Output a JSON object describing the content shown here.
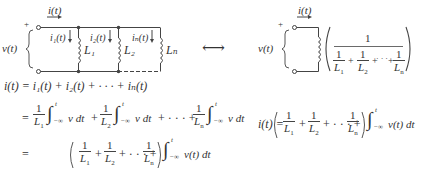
{
  "left_circuit": {
    "current_label": "i(t)",
    "voltage_label": "v(t)",
    "plus_sign": "+",
    "branches": [
      {
        "current": "i₁(t)",
        "inductor": "L₁"
      },
      {
        "current": "i₂(t)",
        "inductor": "L₂"
      },
      {
        "current": "iₙ(t)",
        "inductor": "Lₙ"
      }
    ]
  },
  "equivalence_symbol": "⟷",
  "right_circuit": {
    "current_label": "i(t)",
    "voltage_label": "v(t)",
    "plus_sign": "+",
    "numerator": "1",
    "denominator_terms": [
      "L₁",
      "L₂",
      "Lₙ"
    ],
    "one": "1",
    "plus": "+",
    "dots": "· · ·"
  },
  "equations": {
    "line1": "i(t) = i₁(t) + i₂(t) + · · · + iₙ(t)",
    "eq": "=",
    "integral": "∫",
    "upper_limit": "t",
    "lower_limit": "−∞",
    "v_dt": "v dt",
    "vt_dt": "v(t) dt",
    "result_lhs": "i(t) ="
  }
}
